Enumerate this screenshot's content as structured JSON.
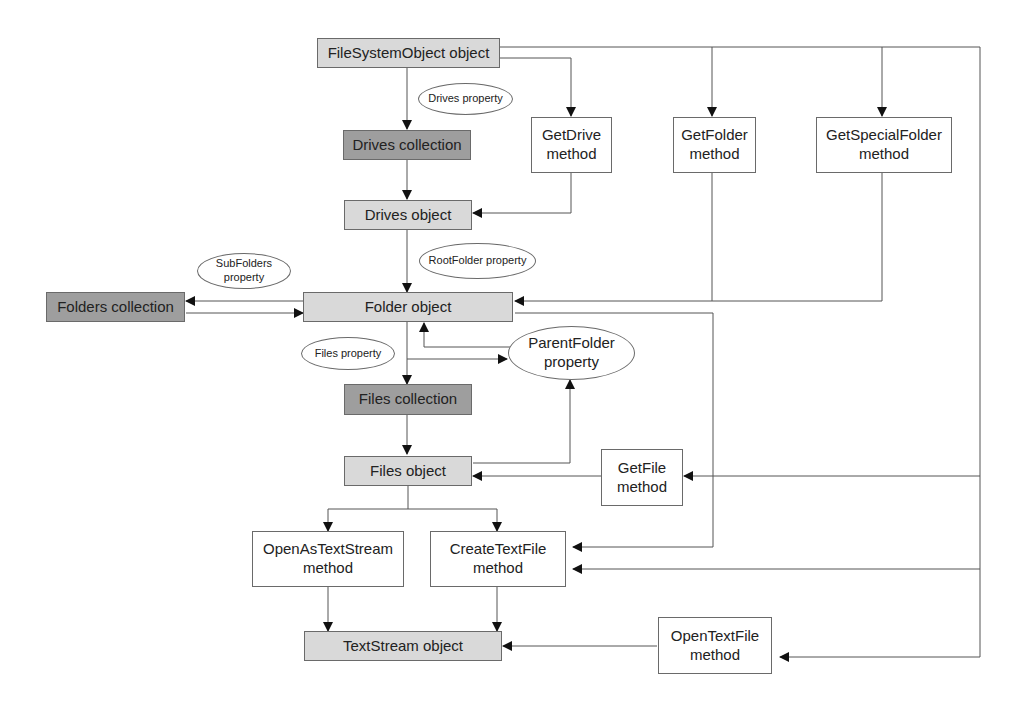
{
  "diagram": {
    "nodes": {
      "fso": "FileSystemObject object",
      "drives_collection": "Drives collection",
      "drives_object": "Drives object",
      "folders_collection": "Folders collection",
      "folder_object": "Folder object",
      "files_collection": "Files collection",
      "files_object": "Files object",
      "textstream_object": "TextStream object",
      "getdrive_l1": "GetDrive",
      "getdrive_l2": "method",
      "getfolder_l1": "GetFolder",
      "getfolder_l2": "method",
      "getspecialfolder_l1": "GetSpecialFolder",
      "getspecialfolder_l2": "method",
      "getfile_l1": "GetFile",
      "getfile_l2": "method",
      "openastextstream_l1": "OpenAsTextStream",
      "openastextstream_l2": "method",
      "createtextfile_l1": "CreateTextFile",
      "createtextfile_l2": "method",
      "opentextfile_l1": "OpenTextFile",
      "opentextfile_l2": "method"
    },
    "properties": {
      "drives": "Drives property",
      "rootfolder": "RootFolder property",
      "subfolders_l1": "SubFolders",
      "subfolders_l2": "property",
      "files": "Files property",
      "parentfolder_l1": "ParentFolder",
      "parentfolder_l2": "property"
    },
    "colors": {
      "object": "#d9d9d9",
      "collection": "#9e9e9e",
      "method": "#ffffff",
      "line": "#555555"
    }
  }
}
